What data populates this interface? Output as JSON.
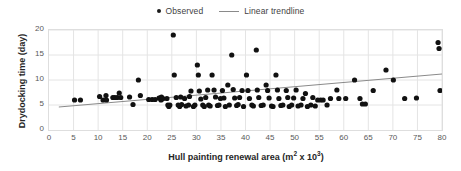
{
  "legend": {
    "position": "top-center",
    "entries": [
      {
        "label": "Observed",
        "marker": "dot-marker-icon",
        "color": "#1a1a1a"
      },
      {
        "label": "Linear trendline",
        "marker": "line-marker-icon",
        "color": "#8a8a8a"
      }
    ]
  },
  "axis_titles": {
    "y": "Drydocking time (day)",
    "x_main": "Hull painting renewal area (m",
    "x_sup1": "2",
    "x_mid": " x 10",
    "x_sup2": "3",
    "x_end": ")"
  },
  "chart_data": {
    "type": "scatter",
    "title": "",
    "xlabel": "Hull painting renewal area (m² x 10³)",
    "ylabel": "Drydocking time (day)",
    "xlim": [
      0,
      80
    ],
    "ylim": [
      0,
      20
    ],
    "xticks": [
      0,
      5,
      10,
      15,
      20,
      25,
      30,
      35,
      40,
      45,
      50,
      55,
      60,
      65,
      70,
      75,
      80
    ],
    "yticks": [
      0,
      5,
      10,
      15,
      20
    ],
    "grid": true,
    "grid_color": "#e4e4e4",
    "marker_color": "#111111",
    "marker_size": 2.6,
    "series": [
      {
        "name": "Observed",
        "type": "scatter",
        "points": [
          [
            5.2,
            6.0
          ],
          [
            6.4,
            6.0
          ],
          [
            10.3,
            6.7
          ],
          [
            11.0,
            6.0
          ],
          [
            11.6,
            6.9
          ],
          [
            11.7,
            6.0
          ],
          [
            13.0,
            6.5
          ],
          [
            13.4,
            6.5
          ],
          [
            13.9,
            6.5
          ],
          [
            14.3,
            7.4
          ],
          [
            14.6,
            6.5
          ],
          [
            16.4,
            6.6
          ],
          [
            17.1,
            5.1
          ],
          [
            18.2,
            10.0
          ],
          [
            18.6,
            6.9
          ],
          [
            20.3,
            6.1
          ],
          [
            21.0,
            6.1
          ],
          [
            21.6,
            6.1
          ],
          [
            22.4,
            6.4
          ],
          [
            22.6,
            6.4
          ],
          [
            22.8,
            6.0
          ],
          [
            22.9,
            6.6
          ],
          [
            23.0,
            6.2
          ],
          [
            23.2,
            6.3
          ],
          [
            24.0,
            6.3
          ],
          [
            24.2,
            5.0
          ],
          [
            24.4,
            4.7
          ],
          [
            24.6,
            5.0
          ],
          [
            25.3,
            19.0
          ],
          [
            25.5,
            11.0
          ],
          [
            25.9,
            6.5
          ],
          [
            26.3,
            5.0
          ],
          [
            26.6,
            4.7
          ],
          [
            26.8,
            6.6
          ],
          [
            27.0,
            5.1
          ],
          [
            27.6,
            6.3
          ],
          [
            27.9,
            4.8
          ],
          [
            28.4,
            5.0
          ],
          [
            28.6,
            6.7
          ],
          [
            28.9,
            7.8
          ],
          [
            29.4,
            4.7
          ],
          [
            29.7,
            5.0
          ],
          [
            30.2,
            13.0
          ],
          [
            30.4,
            11.0
          ],
          [
            30.6,
            7.8
          ],
          [
            30.9,
            6.2
          ],
          [
            31.3,
            5.0
          ],
          [
            31.6,
            4.7
          ],
          [
            31.9,
            6.5
          ],
          [
            32.3,
            8.0
          ],
          [
            32.5,
            5.0
          ],
          [
            32.8,
            4.8
          ],
          [
            33.2,
            11.0
          ],
          [
            33.6,
            8.0
          ],
          [
            33.9,
            6.6
          ],
          [
            34.3,
            4.9
          ],
          [
            34.6,
            5.0
          ],
          [
            34.9,
            6.3
          ],
          [
            35.3,
            7.9
          ],
          [
            35.6,
            6.4
          ],
          [
            35.9,
            4.7
          ],
          [
            36.4,
            9.0
          ],
          [
            36.7,
            5.0
          ],
          [
            37.2,
            15.0
          ],
          [
            37.5,
            8.1
          ],
          [
            37.8,
            6.4
          ],
          [
            38.2,
            4.9
          ],
          [
            38.5,
            5.1
          ],
          [
            38.8,
            6.5
          ],
          [
            39.3,
            7.9
          ],
          [
            39.6,
            4.7
          ],
          [
            40.2,
            11.0
          ],
          [
            40.5,
            7.9
          ],
          [
            40.8,
            6.3
          ],
          [
            41.3,
            5.0
          ],
          [
            41.6,
            4.8
          ],
          [
            42.2,
            16.0
          ],
          [
            42.4,
            8.0
          ],
          [
            42.7,
            6.5
          ],
          [
            43.2,
            4.9
          ],
          [
            43.6,
            5.0
          ],
          [
            44.2,
            9.0
          ],
          [
            44.5,
            7.9
          ],
          [
            44.8,
            6.4
          ],
          [
            45.3,
            4.8
          ],
          [
            45.6,
            4.7
          ],
          [
            46.2,
            11.0
          ],
          [
            46.5,
            8.0
          ],
          [
            46.8,
            6.3
          ],
          [
            47.2,
            4.9
          ],
          [
            47.6,
            5.0
          ],
          [
            48.3,
            7.9
          ],
          [
            48.6,
            6.5
          ],
          [
            48.9,
            4.7
          ],
          [
            49.4,
            5.0
          ],
          [
            49.8,
            6.4
          ],
          [
            50.3,
            8.0
          ],
          [
            50.7,
            4.8
          ],
          [
            51.3,
            5.0
          ],
          [
            51.7,
            6.3
          ],
          [
            52.2,
            7.3
          ],
          [
            52.6,
            4.7
          ],
          [
            53.3,
            5.0
          ],
          [
            53.7,
            6.5
          ],
          [
            54.2,
            4.8
          ],
          [
            54.7,
            6.0
          ],
          [
            55.3,
            6.0
          ],
          [
            55.8,
            6.0
          ],
          [
            56.6,
            5.0
          ],
          [
            57.3,
            6.3
          ],
          [
            58.6,
            8.0
          ],
          [
            59.0,
            6.3
          ],
          [
            60.4,
            6.3
          ],
          [
            62.2,
            10.0
          ],
          [
            63.3,
            6.3
          ],
          [
            63.8,
            5.2
          ],
          [
            64.4,
            5.2
          ],
          [
            66.0,
            7.9
          ],
          [
            68.6,
            12.0
          ],
          [
            70.1,
            10.0
          ],
          [
            72.4,
            6.3
          ],
          [
            74.8,
            6.4
          ],
          [
            79.2,
            17.5
          ],
          [
            79.4,
            16.3
          ],
          [
            79.6,
            7.9
          ]
        ]
      },
      {
        "name": "Linear trendline",
        "type": "line",
        "color": "#8a8a8a",
        "endpoints": [
          [
            2.0,
            4.6
          ],
          [
            80.0,
            11.2
          ]
        ]
      }
    ]
  }
}
